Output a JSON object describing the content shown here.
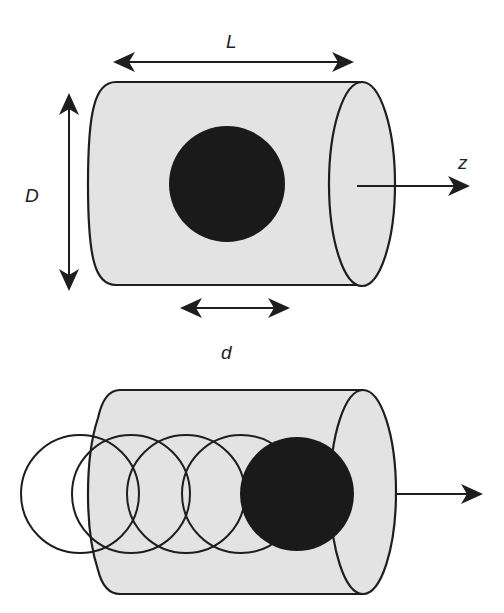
{
  "colors": {
    "background": "#ffffff",
    "cylinder_fill": "#e3e3e3",
    "stroke": "#1e1e1e",
    "particle_fill": "#1a1a1a"
  },
  "top_figure": {
    "labels": {
      "length": "L",
      "diameter": "D",
      "axis": "z",
      "particle_size": "d"
    },
    "particle": {
      "state": "single particle centered in cylinder"
    }
  },
  "bottom_figure": {
    "trail_circles": 4,
    "particle": {
      "state": "particle displaced along axis, leaving overlapping trail"
    }
  }
}
